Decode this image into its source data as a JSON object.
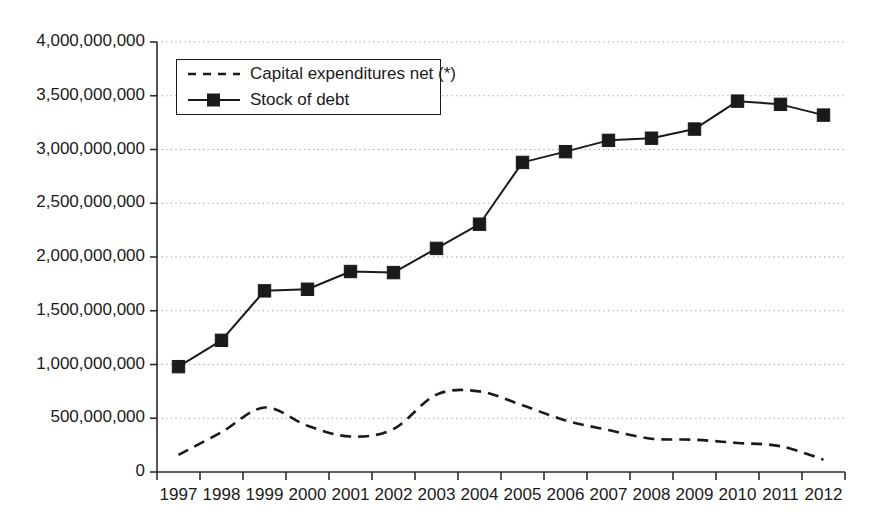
{
  "chart_data": {
    "type": "line",
    "title": "",
    "subtitle": "",
    "xlabel": "",
    "ylabel": "",
    "categories": [
      "1997",
      "1998",
      "1999",
      "2000",
      "2001",
      "2002",
      "2003",
      "2004",
      "2005",
      "2006",
      "2007",
      "2008",
      "2009",
      "2010",
      "2011",
      "2012"
    ],
    "x": [
      1997,
      1998,
      1999,
      2000,
      2001,
      2002,
      2003,
      2004,
      2005,
      2006,
      2007,
      2008,
      2009,
      2010,
      2011,
      2012
    ],
    "ylim": [
      0,
      4000000000
    ],
    "yticks": [
      0,
      500000000,
      1000000000,
      1500000000,
      2000000000,
      2500000000,
      3000000000,
      3500000000,
      4000000000
    ],
    "ytick_labels": [
      "0",
      "500,000,000",
      "1,000,000,000",
      "1,500,000,000",
      "2,000,000,000",
      "2,500,000,000",
      "3,000,000,000",
      "3,500,000,000",
      "4,000,000,000"
    ],
    "grid": "horizontal-dotted",
    "legend_position": "upper-left-inside",
    "series": [
      {
        "name": "Capital expenditures net (*)",
        "style": "dashed",
        "marker": "none",
        "color": "#1a1a1a",
        "values": [
          160000000,
          370000000,
          600000000,
          430000000,
          330000000,
          400000000,
          720000000,
          750000000,
          620000000,
          480000000,
          390000000,
          310000000,
          300000000,
          270000000,
          240000000,
          115000000
        ]
      },
      {
        "name": "Stock of debt",
        "style": "solid",
        "marker": "square",
        "color": "#1a1a1a",
        "values": [
          980000000,
          1225000000,
          1685000000,
          1700000000,
          1865000000,
          1855000000,
          2080000000,
          2305000000,
          2880000000,
          2980000000,
          3085000000,
          3105000000,
          3190000000,
          3450000000,
          3420000000,
          3320000000
        ]
      }
    ]
  },
  "legend": {
    "items": [
      {
        "label": "Capital expenditures net (*)",
        "style": "dashed"
      },
      {
        "label": "Stock of debt",
        "style": "solid-square"
      }
    ]
  },
  "colors": {
    "axis": "#2b2b2b",
    "series": "#1a1a1a",
    "grid": "#9a9a9a",
    "background": "#ffffff"
  }
}
